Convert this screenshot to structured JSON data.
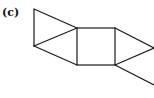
{
  "figure": {
    "label": "(c)",
    "stroke_color": "#1a1a1a"
  }
}
